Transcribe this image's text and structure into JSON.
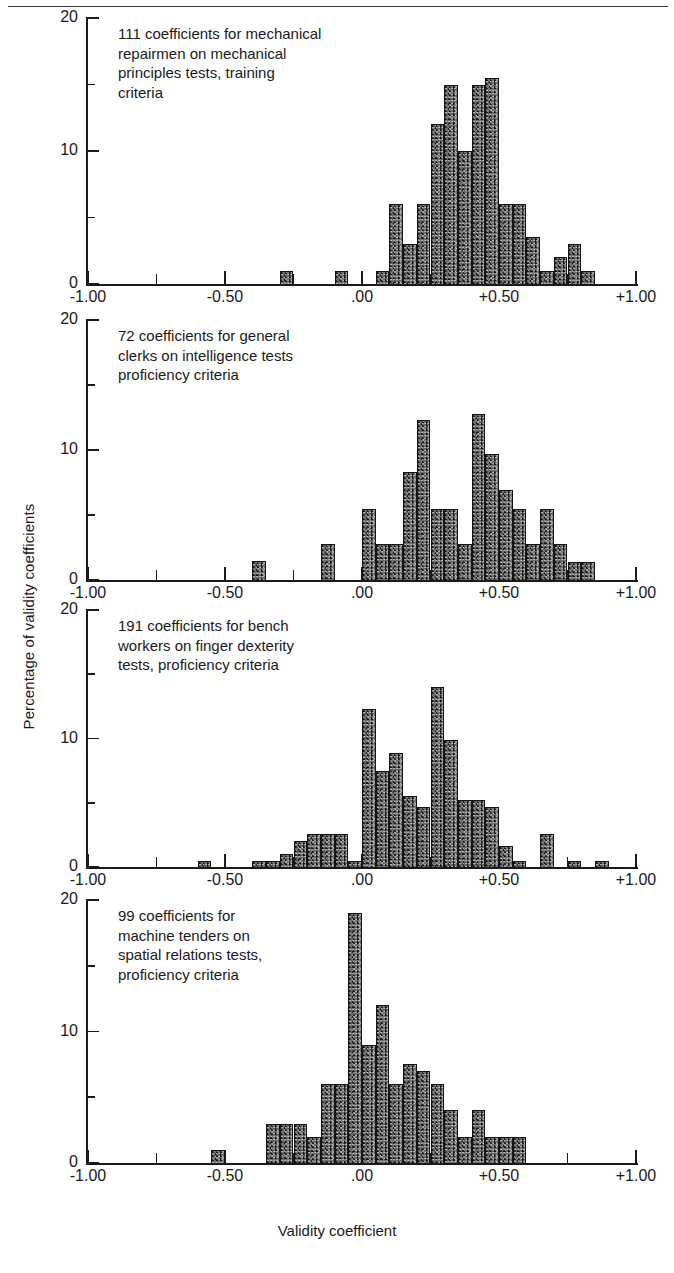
{
  "figure": {
    "xlabel": "Validity coefficient",
    "ylabel": "Percentage of validity coefficients"
  },
  "chart_data": [
    {
      "type": "bar",
      "title": "111 coefficients for mechanical\nrepairmen on mechanical\nprinciples tests, training\ncriteria",
      "xlabel": "Validity coefficient",
      "ylabel": "Percentage of validity coefficients",
      "xlim": [
        -1.0,
        1.0
      ],
      "ylim": [
        0,
        20
      ],
      "xticks": [
        -1.0,
        -0.5,
        0.0,
        0.5,
        1.0
      ],
      "xtick_labels": [
        "-1.00",
        "-0.50",
        ".00",
        "+0.50",
        "+1.00"
      ],
      "xminor_ticks": [
        -0.75,
        -0.25,
        0.25,
        0.75
      ],
      "yticks": [
        0,
        10,
        20
      ],
      "ytick_labels": [
        "0",
        "10",
        "20"
      ],
      "yminor_ticks": [
        5,
        15
      ],
      "grid": false,
      "bin_width": 0.05,
      "bins": [
        {
          "x": -0.3,
          "value": 1
        },
        {
          "x": -0.1,
          "value": 1
        },
        {
          "x": 0.05,
          "value": 1
        },
        {
          "x": 0.1,
          "value": 6
        },
        {
          "x": 0.15,
          "value": 3
        },
        {
          "x": 0.2,
          "value": 6
        },
        {
          "x": 0.25,
          "value": 12
        },
        {
          "x": 0.3,
          "value": 15
        },
        {
          "x": 0.35,
          "value": 10
        },
        {
          "x": 0.4,
          "value": 15
        },
        {
          "x": 0.45,
          "value": 15.5
        },
        {
          "x": 0.5,
          "value": 6
        },
        {
          "x": 0.55,
          "value": 6
        },
        {
          "x": 0.6,
          "value": 3.5
        },
        {
          "x": 0.65,
          "value": 1
        },
        {
          "x": 0.7,
          "value": 2
        },
        {
          "x": 0.75,
          "value": 3
        },
        {
          "x": 0.8,
          "value": 1
        }
      ]
    },
    {
      "type": "bar",
      "title": "72 coefficients for general\nclerks on intelligence tests\nproficiency criteria",
      "xlabel": "Validity coefficient",
      "ylabel": "Percentage of validity coefficients",
      "xlim": [
        -1.0,
        1.0
      ],
      "ylim": [
        0,
        20
      ],
      "xticks": [
        -1.0,
        -0.5,
        0.0,
        0.5,
        1.0
      ],
      "xtick_labels": [
        "-1.00",
        "-0.50",
        ".00",
        "+0.50",
        "+1.00"
      ],
      "xminor_ticks": [
        -0.75,
        -0.25,
        0.25,
        0.75
      ],
      "yticks": [
        0,
        10,
        20
      ],
      "ytick_labels": [
        "0",
        "10",
        "20"
      ],
      "yminor_ticks": [
        5,
        15
      ],
      "grid": false,
      "bin_width": 0.05,
      "bins": [
        {
          "x": -0.4,
          "value": 1.5
        },
        {
          "x": -0.15,
          "value": 2.8
        },
        {
          "x": 0.0,
          "value": 5.5
        },
        {
          "x": 0.05,
          "value": 2.8
        },
        {
          "x": 0.1,
          "value": 2.8
        },
        {
          "x": 0.15,
          "value": 8.3
        },
        {
          "x": 0.2,
          "value": 12.3
        },
        {
          "x": 0.25,
          "value": 5.5
        },
        {
          "x": 0.3,
          "value": 5.5
        },
        {
          "x": 0.35,
          "value": 2.8
        },
        {
          "x": 0.4,
          "value": 12.8
        },
        {
          "x": 0.45,
          "value": 9.7
        },
        {
          "x": 0.5,
          "value": 6.9
        },
        {
          "x": 0.55,
          "value": 5.5
        },
        {
          "x": 0.6,
          "value": 2.8
        },
        {
          "x": 0.65,
          "value": 5.5
        },
        {
          "x": 0.7,
          "value": 2.8
        },
        {
          "x": 0.75,
          "value": 1.4
        },
        {
          "x": 0.8,
          "value": 1.4
        }
      ]
    },
    {
      "type": "bar",
      "title": "191 coefficients for bench\nworkers on finger dexterity\ntests, proficiency criteria",
      "xlabel": "Validity coefficient",
      "ylabel": "Percentage of validity coefficients",
      "xlim": [
        -1.0,
        1.0
      ],
      "ylim": [
        0,
        20
      ],
      "xticks": [
        -1.0,
        -0.5,
        0.0,
        0.5,
        1.0
      ],
      "xtick_labels": [
        "-1.00",
        "-0.50",
        ".00",
        "+0.50",
        "+1.00"
      ],
      "xminor_ticks": [
        -0.75,
        -0.25,
        0.25,
        0.75
      ],
      "yticks": [
        0,
        10,
        20
      ],
      "ytick_labels": [
        "0",
        "10",
        "20"
      ],
      "yminor_ticks": [
        5,
        15
      ],
      "grid": false,
      "bin_width": 0.05,
      "bins": [
        {
          "x": -0.6,
          "value": 0.5
        },
        {
          "x": -0.4,
          "value": 0.5
        },
        {
          "x": -0.35,
          "value": 0.5
        },
        {
          "x": -0.3,
          "value": 1.0
        },
        {
          "x": -0.25,
          "value": 2.0
        },
        {
          "x": -0.2,
          "value": 2.6
        },
        {
          "x": -0.15,
          "value": 2.6
        },
        {
          "x": -0.1,
          "value": 2.6
        },
        {
          "x": -0.05,
          "value": 0.5
        },
        {
          "x": 0.0,
          "value": 12.3
        },
        {
          "x": 0.05,
          "value": 7.5
        },
        {
          "x": 0.1,
          "value": 8.9
        },
        {
          "x": 0.15,
          "value": 5.5
        },
        {
          "x": 0.2,
          "value": 4.7
        },
        {
          "x": 0.25,
          "value": 14.0
        },
        {
          "x": 0.3,
          "value": 9.9
        },
        {
          "x": 0.35,
          "value": 5.2
        },
        {
          "x": 0.4,
          "value": 5.2
        },
        {
          "x": 0.45,
          "value": 4.7
        },
        {
          "x": 0.5,
          "value": 1.6
        },
        {
          "x": 0.55,
          "value": 0.5
        },
        {
          "x": 0.65,
          "value": 2.6
        },
        {
          "x": 0.75,
          "value": 0.5
        },
        {
          "x": 0.85,
          "value": 0.5
        }
      ]
    },
    {
      "type": "bar",
      "title": "99 coefficients for\nmachine tenders on\nspatial relations tests,\nproficiency criteria",
      "xlabel": "Validity coefficient",
      "ylabel": "Percentage of validity coefficients",
      "xlim": [
        -1.0,
        1.0
      ],
      "ylim": [
        0,
        20
      ],
      "xticks": [
        -1.0,
        -0.5,
        0.0,
        0.5,
        1.0
      ],
      "xtick_labels": [
        "-1.00",
        "-0.50",
        ".00",
        "+0.50",
        "+1.00"
      ],
      "xminor_ticks": [
        -0.75,
        -0.25,
        0.25,
        0.75
      ],
      "yticks": [
        0,
        10,
        20
      ],
      "ytick_labels": [
        "0",
        "10",
        "20"
      ],
      "yminor_ticks": [
        5,
        15
      ],
      "grid": false,
      "bin_width": 0.05,
      "bins": [
        {
          "x": -0.55,
          "value": 1.0
        },
        {
          "x": -0.35,
          "value": 3.0
        },
        {
          "x": -0.3,
          "value": 3.0
        },
        {
          "x": -0.25,
          "value": 3.0
        },
        {
          "x": -0.2,
          "value": 2.0
        },
        {
          "x": -0.15,
          "value": 6.0
        },
        {
          "x": -0.1,
          "value": 6.0
        },
        {
          "x": -0.05,
          "value": 19.0
        },
        {
          "x": 0.0,
          "value": 9.0
        },
        {
          "x": 0.05,
          "value": 12.0
        },
        {
          "x": 0.1,
          "value": 6.0
        },
        {
          "x": 0.15,
          "value": 7.5
        },
        {
          "x": 0.2,
          "value": 7.0
        },
        {
          "x": 0.25,
          "value": 6.0
        },
        {
          "x": 0.3,
          "value": 4.0
        },
        {
          "x": 0.35,
          "value": 2.0
        },
        {
          "x": 0.4,
          "value": 4.0
        },
        {
          "x": 0.45,
          "value": 2.0
        },
        {
          "x": 0.5,
          "value": 2.0
        },
        {
          "x": 0.55,
          "value": 2.0
        }
      ]
    }
  ]
}
